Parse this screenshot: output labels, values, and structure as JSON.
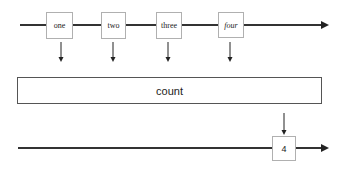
{
  "diagram": {
    "input_stream": {
      "items": [
        {
          "label": "one"
        },
        {
          "label": "two"
        },
        {
          "label": "three"
        },
        {
          "label": "four"
        }
      ]
    },
    "operator": {
      "label": "count"
    },
    "output_stream": {
      "items": [
        {
          "label": "4"
        }
      ]
    },
    "colors": {
      "line": "#222222",
      "box_border": "#b0b0b0",
      "operator_border": "#555555"
    }
  }
}
